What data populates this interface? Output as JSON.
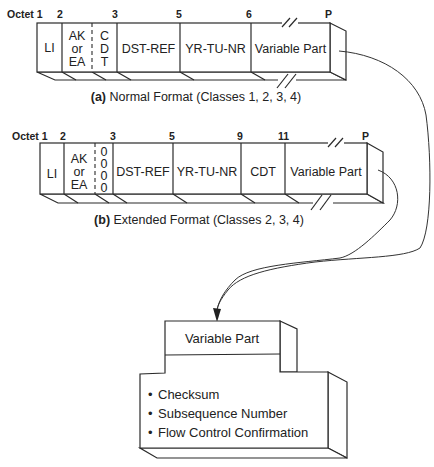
{
  "figure_a": {
    "octet_labels": [
      "Octet 1",
      "2",
      "3",
      "5",
      "6",
      "P"
    ],
    "fields": [
      "LI",
      "AK",
      "or",
      "EA",
      "C",
      "D",
      "T",
      "DST-REF",
      "YR-TU-NR",
      "Variable Part"
    ],
    "caption_prefix": "(a)",
    "caption_text": " Normal Format (Classes 1, 2, 3, 4)"
  },
  "figure_b": {
    "octet_labels": [
      "Octet 1",
      "2",
      "3",
      "5",
      "9",
      "11",
      "P"
    ],
    "fields": [
      "LI",
      "AK",
      "or",
      "EA",
      "0",
      "0",
      "0",
      "0",
      "DST-REF",
      "YR-TU-NR",
      "CDT",
      "Variable Part"
    ],
    "caption_prefix": "(b)",
    "caption_text": " Extended Format (Classes 2, 3, 4)"
  },
  "variable_part_box": {
    "title": "Variable Part",
    "items": [
      "Checksum",
      "Subsequence Number",
      "Flow Control Confirmation"
    ],
    "bullet": "•"
  }
}
